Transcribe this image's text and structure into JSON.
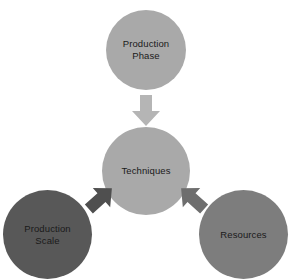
{
  "diagram": {
    "type": "convergence-diagram",
    "background_color": "#ffffff",
    "nodes": [
      {
        "id": "production-phase",
        "label": "Production\nPhase",
        "shape": "circle",
        "color": "#a9a9a9",
        "text_color": "#1a1a1a",
        "position": "top"
      },
      {
        "id": "techniques",
        "label": "Techniques",
        "shape": "circle",
        "color": "#a9a9a9",
        "text_color": "#1a1a1a",
        "position": "center"
      },
      {
        "id": "production-scale",
        "label": "Production\nScale",
        "shape": "circle",
        "color": "#585858",
        "text_color": "#111111",
        "position": "bottom-left"
      },
      {
        "id": "resources",
        "label": "Resources",
        "shape": "circle",
        "color": "#7d7d7d",
        "text_color": "#111111",
        "position": "bottom-right"
      }
    ],
    "arrows": [
      {
        "id": "phase-to-techniques",
        "from": "production-phase",
        "to": "techniques",
        "direction": "down",
        "color": "#b5b5b5"
      },
      {
        "id": "scale-to-techniques",
        "from": "production-scale",
        "to": "techniques",
        "direction": "up-right",
        "color": "#4f4f4f"
      },
      {
        "id": "resources-to-techniques",
        "from": "resources",
        "to": "techniques",
        "direction": "up-left",
        "color": "#6e6e6e"
      }
    ]
  }
}
